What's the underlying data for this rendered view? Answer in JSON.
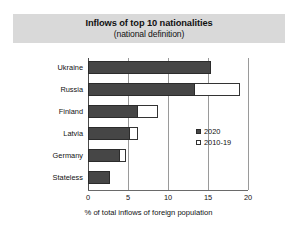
{
  "chart_data": {
    "type": "bar",
    "orientation": "horizontal",
    "title": "Inflows of top 10 nationalities",
    "subtitle": "(national definition)",
    "xlabel": "% of total inflows of foreign population",
    "ylabel": "",
    "xlim": [
      0,
      20
    ],
    "xticks": [
      "0",
      "5",
      "10",
      "15",
      "20"
    ],
    "xtick_values": [
      0,
      5,
      10,
      15,
      20
    ],
    "grid": true,
    "legend_position": "center-right",
    "categories": [
      "Ukraine",
      "Russia",
      "Finland",
      "Latvia",
      "Germany",
      "Stateless"
    ],
    "series": [
      {
        "name": "2020",
        "style": "filled",
        "values": [
          15.4,
          13.4,
          6.3,
          5.3,
          4.0,
          2.8
        ]
      },
      {
        "name": "2010-19",
        "style": "hollow",
        "values": [
          15.4,
          19.0,
          8.8,
          6.2,
          4.8,
          2.8
        ]
      }
    ],
    "colors": {
      "series_2020_fill": "#464646",
      "series_2010_19_fill": "#ffffff",
      "series_2010_19_outline": "#333333",
      "title_band": "#d9d9d9",
      "gridline": "#9a9a9a",
      "background": "#ffffff"
    }
  },
  "legend": {
    "items": [
      {
        "label": "2020"
      },
      {
        "label": "2010-19"
      }
    ]
  }
}
